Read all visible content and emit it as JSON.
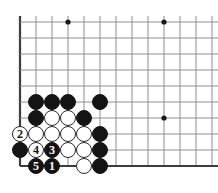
{
  "figure": {
    "name": "go-board-diagram",
    "width": 218,
    "height": 193,
    "background_color": "#ffffff"
  },
  "board": {
    "grid_spacing": 16,
    "origin_x": 20,
    "origin_y": 22,
    "columns": 13,
    "rows": 10,
    "line_color": "#8c8c8c",
    "edge_line_color": "#3c3c3c",
    "line_width": 1,
    "edge_line_width": 2.2,
    "star_point_color": "#1a1a1a",
    "star_point_radius": 2.6,
    "star_points": [
      {
        "x": 68,
        "y": 22
      },
      {
        "x": 164,
        "y": 22
      },
      {
        "x": 164,
        "y": 118
      }
    ],
    "vertical_lines_x": [
      20,
      36,
      52,
      68,
      84,
      100,
      116,
      132,
      148,
      164,
      180,
      196,
      212
    ],
    "horizontal_lines_y": [
      22,
      38,
      54,
      70,
      86,
      102,
      118,
      134,
      150,
      166
    ],
    "left_edge_x": 20,
    "bottom_edge_y": 166
  },
  "stones": {
    "radius": 8.2,
    "black_color": "#141414",
    "white_color": "#ffffff",
    "white_outline_color": "#2a2a2a",
    "items": [
      {
        "id": "b-c36-r102",
        "color": "black",
        "x": 36,
        "y": 102,
        "label": ""
      },
      {
        "id": "b-c52-r102",
        "color": "black",
        "x": 52,
        "y": 102,
        "label": ""
      },
      {
        "id": "b-c68-r102",
        "color": "black",
        "x": 68,
        "y": 102,
        "label": ""
      },
      {
        "id": "b-c100-r102",
        "color": "black",
        "x": 100,
        "y": 102,
        "label": ""
      },
      {
        "id": "b-c36-r118",
        "color": "black",
        "x": 36,
        "y": 118,
        "label": ""
      },
      {
        "id": "w-c52-r118",
        "color": "white",
        "x": 52,
        "y": 118,
        "label": ""
      },
      {
        "id": "w-c68-r118",
        "color": "white",
        "x": 68,
        "y": 118,
        "label": ""
      },
      {
        "id": "b-c84-r118",
        "color": "black",
        "x": 84,
        "y": 118,
        "label": ""
      },
      {
        "id": "w-c20-r134",
        "color": "white",
        "x": 20,
        "y": 134,
        "label": "2"
      },
      {
        "id": "w-c36-r134",
        "color": "white",
        "x": 36,
        "y": 134,
        "label": ""
      },
      {
        "id": "w-c52-r134",
        "color": "white",
        "x": 52,
        "y": 134,
        "label": ""
      },
      {
        "id": "w-c68-r134",
        "color": "white",
        "x": 68,
        "y": 134,
        "label": ""
      },
      {
        "id": "w-c84-r134",
        "color": "white",
        "x": 84,
        "y": 134,
        "label": ""
      },
      {
        "id": "b-c100-r134",
        "color": "black",
        "x": 100,
        "y": 134,
        "label": ""
      },
      {
        "id": "b-c20-r150",
        "color": "black",
        "x": 20,
        "y": 150,
        "label": ""
      },
      {
        "id": "w-c36-r150",
        "color": "white",
        "x": 36,
        "y": 150,
        "label": "4"
      },
      {
        "id": "b-c52-r150",
        "color": "black",
        "x": 52,
        "y": 150,
        "label": "3"
      },
      {
        "id": "w-c68-r150",
        "color": "white",
        "x": 68,
        "y": 150,
        "label": ""
      },
      {
        "id": "w-c84-r150",
        "color": "white",
        "x": 84,
        "y": 150,
        "label": ""
      },
      {
        "id": "b-c100-r150",
        "color": "black",
        "x": 100,
        "y": 150,
        "label": ""
      },
      {
        "id": "b-c36-r166",
        "color": "black",
        "x": 36,
        "y": 166,
        "label": "5"
      },
      {
        "id": "b-c52-r166",
        "color": "black",
        "x": 52,
        "y": 166,
        "label": "1"
      },
      {
        "id": "w-c84-r166",
        "color": "white",
        "x": 84,
        "y": 166,
        "label": ""
      },
      {
        "id": "b-c100-r166",
        "color": "black",
        "x": 100,
        "y": 166,
        "label": ""
      }
    ]
  },
  "move_sequence": {
    "labels": [
      "1",
      "2",
      "3",
      "4",
      "5"
    ]
  }
}
